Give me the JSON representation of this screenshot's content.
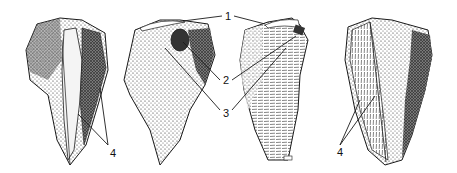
{
  "figure": {
    "views": [
      {
        "id": "view-a",
        "name": "tool-view-left-dorsal"
      },
      {
        "id": "view-b",
        "name": "tool-view-center-left"
      },
      {
        "id": "view-c",
        "name": "tool-view-center-right"
      },
      {
        "id": "view-d",
        "name": "tool-view-right-dorsal"
      }
    ],
    "labels": {
      "one": "1",
      "two": "2",
      "three": "3",
      "four_left": "4",
      "four_right": "4"
    },
    "colors": {
      "ink": "#1a1a1a",
      "paper": "#ffffff"
    }
  }
}
